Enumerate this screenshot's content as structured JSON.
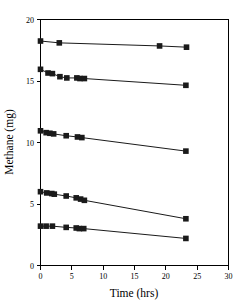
{
  "chart_data": {
    "type": "scatter",
    "title": "",
    "subtitle": "",
    "xlabel": "Time (hrs)",
    "ylabel": "Methane (mg)",
    "xlim": [
      0,
      30
    ],
    "ylim": [
      0,
      20
    ],
    "xticks": [
      0,
      5,
      10,
      15,
      20,
      25,
      30
    ],
    "yticks": [
      0,
      5,
      10,
      15,
      20
    ],
    "xtick_labels": [
      "0",
      "5",
      "10",
      "15",
      "20",
      "25",
      "30"
    ],
    "ytick_labels": [
      "0",
      "5",
      "10",
      "15",
      "20"
    ],
    "grid": false,
    "legend": false,
    "legend_position": "none",
    "marker": "square",
    "marker_color": "#1a1a1a",
    "line_color": "#000000",
    "series": [
      {
        "name": "Series 1",
        "x": [
          0.0,
          3.0,
          19.0,
          23.3
        ],
        "values": [
          18.25,
          18.1,
          17.85,
          17.75
        ]
      },
      {
        "name": "Series 2",
        "x": [
          0.0,
          1.2,
          1.9,
          3.1,
          4.2,
          5.8,
          6.3,
          7.0,
          23.2
        ],
        "values": [
          15.95,
          15.65,
          15.6,
          15.35,
          15.25,
          15.25,
          15.2,
          15.2,
          14.65
        ]
      },
      {
        "name": "Series 3",
        "x": [
          0.0,
          0.9,
          1.5,
          2.1,
          4.1,
          5.9,
          6.6,
          23.2
        ],
        "values": [
          10.95,
          10.8,
          10.75,
          10.7,
          10.55,
          10.45,
          10.4,
          9.3
        ]
      },
      {
        "name": "Series 4",
        "x": [
          0.0,
          1.0,
          1.8,
          2.2,
          4.1,
          5.7,
          6.4,
          7.0,
          23.2
        ],
        "values": [
          6.0,
          5.9,
          5.85,
          5.8,
          5.65,
          5.5,
          5.4,
          5.3,
          3.8
        ]
      },
      {
        "name": "Series 5",
        "x": [
          0.0,
          0.9,
          1.9,
          4.1,
          5.7,
          6.2,
          6.9,
          23.2
        ],
        "values": [
          3.2,
          3.2,
          3.2,
          3.1,
          3.05,
          3.0,
          3.0,
          2.2
        ]
      }
    ]
  },
  "axes": {
    "x_title": "Time (hrs)",
    "y_title": "Methane (mg)"
  }
}
